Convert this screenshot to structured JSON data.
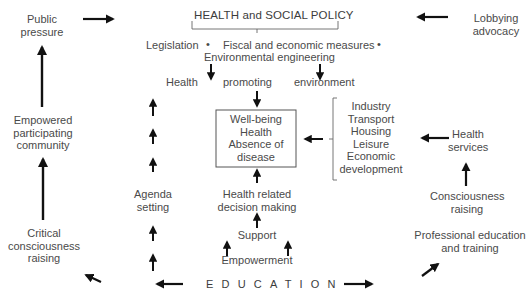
{
  "title": "HEALTH and SOCIAL POLICY",
  "policy_measures": {
    "legislation": "Legislation",
    "fiscal": "Fiscal and economic measures",
    "environmental": "Environmental engineering",
    "bullet": "•"
  },
  "health_promoting_environment": {
    "word1": "Health",
    "word2": "promoting",
    "word3": "environment"
  },
  "central_box": {
    "lines": [
      "Well-being",
      "Health",
      "Absence of",
      "disease"
    ]
  },
  "sectors": {
    "lines": [
      "Industry",
      "Transport",
      "Housing",
      "Leisure",
      "Economic",
      "development"
    ]
  },
  "left_column": {
    "public_pressure": [
      "Public",
      "pressure"
    ],
    "empowered_community": [
      "Empowered",
      "participating",
      "community"
    ],
    "critical_consciousness": [
      "Critical",
      "consciousness",
      "raising"
    ]
  },
  "agenda_setting": [
    "Agenda",
    "setting"
  ],
  "center_column": {
    "health_related": [
      "Health related",
      "decision making"
    ],
    "support": "Support",
    "empowerment": "Empowerment"
  },
  "right_column": {
    "lobbying": [
      "Lobbying",
      "advocacy"
    ],
    "health_services": [
      "Health",
      "services"
    ],
    "consciousness_raising": [
      "Consciousness",
      "raising"
    ],
    "professional_education": [
      "Professional education",
      "and training"
    ]
  },
  "education": "EDUCATION",
  "colors": {
    "text": "#4a4a4a",
    "arrow": "#111111",
    "line": "#555555",
    "background": "#ffffff"
  }
}
